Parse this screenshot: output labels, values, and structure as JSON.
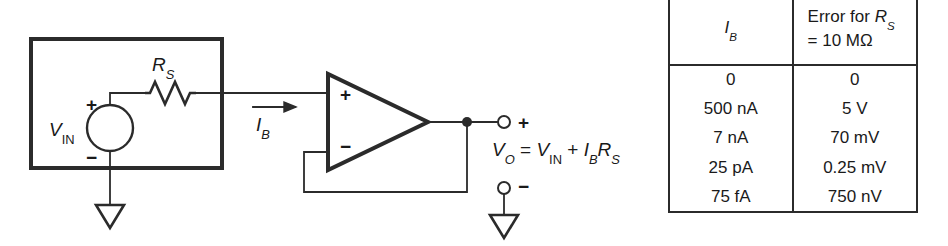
{
  "figure": {
    "kind": "schematic-diagram",
    "background_color": "#ffffff",
    "line_color": "#2b2b2b",
    "text_color": "#1a1a1a"
  },
  "circuit": {
    "source_block": {
      "source_symbol_name": "voltage-source-circle",
      "source_label_main": "V",
      "source_label_sub": "IN",
      "terminal_plus": "+",
      "terminal_minus": "−"
    },
    "resistor": {
      "symbol_name": "resistor-zigzag",
      "label_main": "R",
      "label_sub": "S"
    },
    "bias_current": {
      "arrow_name": "current-direction-arrow",
      "label_main": "I",
      "label_sub": "B"
    },
    "opamp": {
      "symbol_name": "opamp-triangle",
      "noninverting_input": "+",
      "inverting_input": "−",
      "feedback_name": "unity-gain-feedback-wire"
    },
    "output": {
      "terminal_plus": "+",
      "terminal_minus": "−",
      "node_name": "output-junction-dot",
      "equation": {
        "lhs_main": "V",
        "lhs_sub": "O",
        "equals": "=",
        "term1_main": "V",
        "term1_sub": "IN",
        "plus": "+",
        "term2a_main": "I",
        "term2a_sub": "B",
        "term2b_main": "R",
        "term2b_sub": "S",
        "plain": "VO = VIN + IB RS"
      }
    },
    "grounds": [
      {
        "name": "ground-source"
      },
      {
        "name": "ground-output"
      }
    ]
  },
  "table": {
    "columns": [
      {
        "key": "ib",
        "header_main": "I",
        "header_sub": "B",
        "header_plain": "IB"
      },
      {
        "key": "error",
        "header_line1_pre": "Error for ",
        "header_line1_main": "R",
        "header_line1_sub": "S",
        "header_line2": "= 10 MΩ",
        "header_plain": "Error for RS = 10 MΩ"
      }
    ],
    "rows": [
      {
        "ib": "0",
        "error": "0"
      },
      {
        "ib": "500 nA",
        "error": "5 V"
      },
      {
        "ib": "7 nA",
        "error": "70 mV"
      },
      {
        "ib": "25 pA",
        "error": "0.25 mV"
      },
      {
        "ib": "75 fA",
        "error": "750 nV"
      }
    ]
  }
}
